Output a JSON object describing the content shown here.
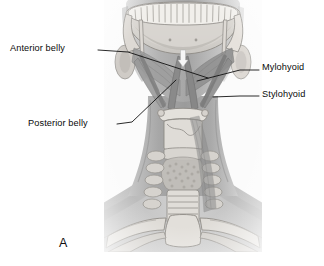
{
  "figure": {
    "panel_letter": "A",
    "background_color": "#ffffff",
    "plate_background": "#fbfbfb",
    "label_color": "#0a0a0a",
    "leader_color": "#121212"
  },
  "labels": [
    {
      "id": "anterior-belly",
      "text": "Anterior belly",
      "side": "left"
    },
    {
      "id": "posterior-belly",
      "text": "Posterior belly",
      "side": "left"
    },
    {
      "id": "mylohyoid",
      "text": "Mylohyoid",
      "side": "right"
    },
    {
      "id": "stylohyoid",
      "text": "Stylohyoid",
      "side": "right"
    }
  ],
  "illustration": {
    "view": "anterior view of head and neck",
    "subject": "suprahyoid muscles of the neck",
    "structures": [
      "mandible with dental arch",
      "anterior belly of digastric muscle",
      "posterior belly of digastric muscle",
      "mylohyoid muscle",
      "stylohyoid muscle",
      "styloid process",
      "hyoid bone",
      "thyroid cartilage",
      "thyroid gland",
      "trachea",
      "cervical vertebrae",
      "clavicle",
      "manubrium of sternum",
      "first rib",
      "sternocleidomastoid muscle"
    ],
    "palette": {
      "skin_silhouette": "#b9b9b9",
      "bone_light": "#e3e1dd",
      "bone_mid": "#cdcac5",
      "muscle_mid": "#9d9d9d",
      "muscle_dark": "#7f7f7f",
      "outline": "#6e6e6e"
    }
  }
}
